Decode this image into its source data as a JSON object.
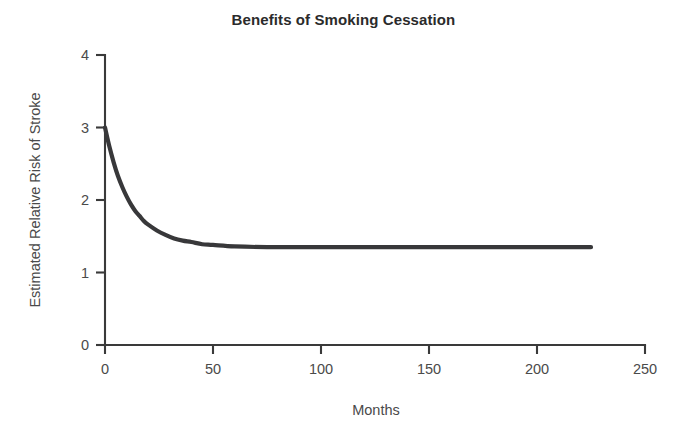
{
  "chart_data": {
    "type": "line",
    "title": "Benefits of Smoking Cessation",
    "xlabel": "Months",
    "ylabel": "Estimated Relative Risk of Stroke",
    "xlim": [
      0,
      250
    ],
    "ylim": [
      0,
      4
    ],
    "xticks": [
      0,
      50,
      100,
      150,
      200,
      250
    ],
    "yticks": [
      0,
      1,
      2,
      3,
      4
    ],
    "xtick_labels": [
      "0",
      "50",
      "100",
      "150",
      "200",
      "250"
    ],
    "ytick_labels": [
      "0",
      "1",
      "2",
      "3",
      "4"
    ],
    "grid": false,
    "legend": false,
    "line_color": "#38383a",
    "series": [
      {
        "name": "Estimated Relative Risk of Stroke",
        "x": [
          0,
          2,
          4,
          6,
          8,
          10,
          12,
          14,
          16,
          18,
          20,
          24,
          28,
          32,
          36,
          40,
          45,
          50,
          60,
          75,
          100,
          125,
          150,
          175,
          200,
          225
        ],
        "values": [
          3.0,
          2.74,
          2.52,
          2.33,
          2.18,
          2.05,
          1.94,
          1.85,
          1.78,
          1.71,
          1.66,
          1.58,
          1.52,
          1.47,
          1.44,
          1.42,
          1.39,
          1.38,
          1.36,
          1.35,
          1.35,
          1.35,
          1.35,
          1.35,
          1.35,
          1.35
        ]
      }
    ],
    "annotations": {
      "initial_risk": 3.0,
      "plateau_risk": 1.35,
      "plateau_onset_months": 45,
      "curve_end_months": 225
    }
  }
}
